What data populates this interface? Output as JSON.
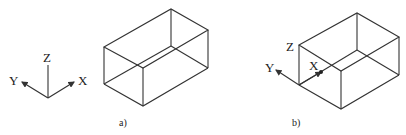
{
  "panels": [
    {
      "caption": "a)",
      "axes": {
        "x": "X",
        "y": "Y",
        "z": "Z"
      }
    },
    {
      "caption": "b)",
      "axes": {
        "x": "X",
        "y": "Y",
        "z": "Z"
      }
    }
  ],
  "colors": {
    "line": "#333333",
    "background": "#ffffff"
  }
}
